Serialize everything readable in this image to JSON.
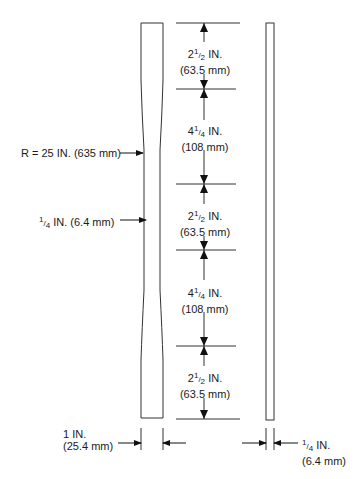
{
  "diagram": {
    "type": "tensile test specimen drawing",
    "segments": [
      {
        "whole": "2",
        "num": "1",
        "den": "2",
        "unit": "IN.",
        "metric": "(63.5 mm)"
      },
      {
        "whole": "4",
        "num": "1",
        "den": "4",
        "unit": "IN.",
        "metric": "(108 mm)"
      },
      {
        "whole": "2",
        "num": "1",
        "den": "2",
        "unit": "IN.",
        "metric": "(63.5 mm)"
      },
      {
        "whole": "4",
        "num": "1",
        "den": "4",
        "unit": "IN.",
        "metric": "(108 mm)"
      },
      {
        "whole": "2",
        "num": "1",
        "den": "2",
        "unit": "IN.",
        "metric": "(63.5 mm)"
      }
    ],
    "radius_label": "R = 25 IN. (635 mm)",
    "narrow_width": {
      "num": "1",
      "den": "4",
      "text": " IN. (6.4 mm)"
    },
    "full_width": {
      "line1": "1 IN.",
      "line2": "(25.4 mm)"
    },
    "thickness": {
      "num": "1",
      "den": "4",
      "line1_rest": " IN.",
      "line2": "(6.4 mm)"
    }
  }
}
